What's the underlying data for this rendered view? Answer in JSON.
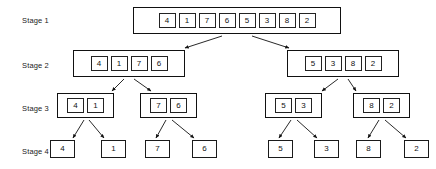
{
  "figure": {
    "background_color": "#ffffff",
    "line_color": "#111111",
    "text_color": "#111111"
  },
  "stage_labels": [
    {
      "id": "stage-1",
      "text": "Stage 1",
      "x": 22,
      "y": 17
    },
    {
      "id": "stage-2",
      "text": "Stage 2",
      "x": 22,
      "y": 62
    },
    {
      "id": "stage-3",
      "text": "Stage 3",
      "x": 22,
      "y": 105
    },
    {
      "id": "stage-4",
      "text": "Stage 4",
      "x": 22,
      "y": 148
    }
  ],
  "stage1": {
    "groups": [
      {
        "id": "stage1-array",
        "x": 133,
        "y": 7,
        "w": 208,
        "h": 27,
        "values": [
          "4",
          "1",
          "7",
          "6",
          "5",
          "3",
          "8",
          "2"
        ]
      }
    ]
  },
  "stage2": {
    "groups": [
      {
        "id": "stage2-left",
        "x": 73,
        "y": 50,
        "w": 112,
        "h": 27,
        "values": [
          "4",
          "1",
          "7",
          "6"
        ]
      },
      {
        "id": "stage2-right",
        "x": 287,
        "y": 50,
        "w": 112,
        "h": 27,
        "values": [
          "5",
          "3",
          "8",
          "2"
        ]
      }
    ]
  },
  "stage3": {
    "groups": [
      {
        "id": "stage3-g1",
        "x": 57,
        "y": 93,
        "w": 57,
        "h": 25,
        "values": [
          "4",
          "1"
        ]
      },
      {
        "id": "stage3-g2",
        "x": 140,
        "y": 93,
        "w": 57,
        "h": 25,
        "values": [
          "7",
          "6"
        ]
      },
      {
        "id": "stage3-g3",
        "x": 265,
        "y": 93,
        "w": 57,
        "h": 25,
        "values": [
          "5",
          "3"
        ]
      },
      {
        "id": "stage3-g4",
        "x": 353,
        "y": 93,
        "w": 57,
        "h": 25,
        "values": [
          "8",
          "2"
        ]
      }
    ]
  },
  "stage4": {
    "leaves": [
      {
        "id": "leaf-1",
        "value": "4",
        "x": 50,
        "y": 140
      },
      {
        "id": "leaf-2",
        "value": "1",
        "x": 101,
        "y": 140
      },
      {
        "id": "leaf-3",
        "value": "7",
        "x": 145,
        "y": 140
      },
      {
        "id": "leaf-4",
        "value": "6",
        "x": 192,
        "y": 140
      },
      {
        "id": "leaf-5",
        "value": "5",
        "x": 268,
        "y": 140
      },
      {
        "id": "leaf-6",
        "value": "3",
        "x": 314,
        "y": 140
      },
      {
        "id": "leaf-7",
        "value": "8",
        "x": 356,
        "y": 140
      },
      {
        "id": "leaf-8",
        "value": "2",
        "x": 404,
        "y": 140
      }
    ]
  },
  "arrows": [
    {
      "id": "a1-left",
      "x1": 222,
      "y1": 36,
      "x2": 185,
      "y2": 48
    },
    {
      "id": "a1-right",
      "x1": 252,
      "y1": 36,
      "x2": 289,
      "y2": 48
    },
    {
      "id": "a2l-left",
      "x1": 124,
      "y1": 79,
      "x2": 112,
      "y2": 91
    },
    {
      "id": "a2l-right",
      "x1": 134,
      "y1": 79,
      "x2": 151,
      "y2": 91
    },
    {
      "id": "a2r-left",
      "x1": 338,
      "y1": 79,
      "x2": 322,
      "y2": 91
    },
    {
      "id": "a2r-right",
      "x1": 348,
      "y1": 79,
      "x2": 356,
      "y2": 91
    },
    {
      "id": "a3a-left",
      "x1": 84,
      "y1": 120,
      "x2": 73,
      "y2": 138
    },
    {
      "id": "a3a-right",
      "x1": 89,
      "y1": 120,
      "x2": 104,
      "y2": 138
    },
    {
      "id": "a3b-left",
      "x1": 166,
      "y1": 120,
      "x2": 156,
      "y2": 138
    },
    {
      "id": "a3b-right",
      "x1": 172,
      "y1": 120,
      "x2": 194,
      "y2": 138
    },
    {
      "id": "a3c-left",
      "x1": 291,
      "y1": 120,
      "x2": 279,
      "y2": 138
    },
    {
      "id": "a3c-right",
      "x1": 297,
      "y1": 120,
      "x2": 317,
      "y2": 138
    },
    {
      "id": "a3d-left",
      "x1": 379,
      "y1": 120,
      "x2": 368,
      "y2": 138
    },
    {
      "id": "a3d-right",
      "x1": 385,
      "y1": 120,
      "x2": 406,
      "y2": 138
    }
  ]
}
